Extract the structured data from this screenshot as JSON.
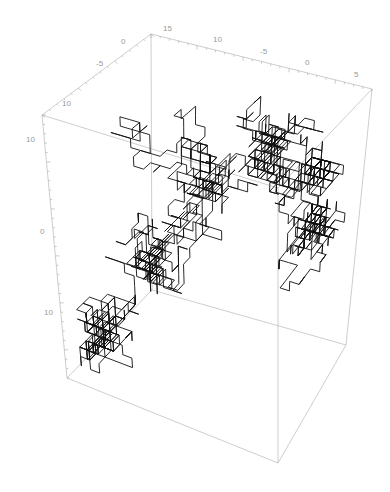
{
  "chart_data": {
    "type": "line3d",
    "title": "",
    "axes": {
      "x": {
        "label": "",
        "tick_labels": [
          "10",
          "-5",
          "0"
        ],
        "range": [
          -12,
          2
        ]
      },
      "y": {
        "label": "",
        "tick_labels": [
          "-15",
          "10",
          "-5",
          "0",
          "5"
        ],
        "range": [
          -17,
          6
        ]
      },
      "z": {
        "label": "",
        "tick_labels": [
          "10",
          "0",
          "10"
        ],
        "range": [
          -16,
          12
        ]
      }
    },
    "tick_label_positions_note": "edge labels only",
    "series": [
      {
        "name": "random-walk",
        "color": "#111111",
        "steps": 2000,
        "seed": 7,
        "start": [
          -10,
          -14,
          -14
        ],
        "cluster_centers": [
          [
            -10,
            -14,
            -12
          ],
          [
            -8,
            -10,
            -4
          ],
          [
            -4,
            -6,
            2
          ],
          [
            -1,
            -2,
            6
          ],
          [
            1,
            2,
            4
          ],
          [
            0,
            3,
            -2
          ]
        ]
      }
    ],
    "box_color": "#b8b8b8",
    "tick_label_color": "#9a9a9a",
    "grid": false,
    "legend": "none"
  },
  "labels": {
    "x_ticks": [
      "10",
      "-5",
      "0"
    ],
    "y_ticks": [
      "15",
      "10",
      "-5",
      "0",
      "5"
    ],
    "z_ticks": [
      "10",
      "0",
      "10"
    ]
  }
}
